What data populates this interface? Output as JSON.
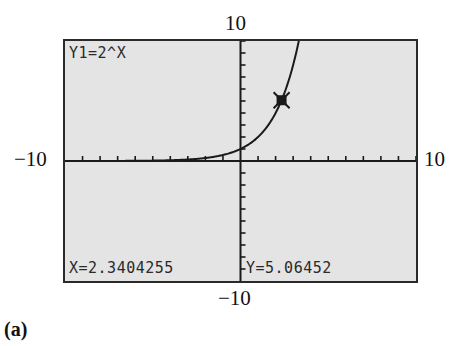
{
  "figure": {
    "sub_label": "(a)"
  },
  "window": {
    "ymax_label": "10",
    "ymin_label": "−10",
    "xmin_label": "−10",
    "xmax_label": "10"
  },
  "screen": {
    "function_label": "Y1=2^X",
    "x_readout": "X=2.3404255",
    "y_readout": "Y=5.06452",
    "background_color": "#e4e4e4",
    "frame_color": "#2a2a2a",
    "curve_color": "#1a1a1a"
  },
  "chart_data": {
    "type": "line",
    "title": "Y1=2^X",
    "function": "y = 2^x",
    "xlabel": "",
    "ylabel": "",
    "xlim": [
      -10,
      10
    ],
    "ylim": [
      -10,
      10
    ],
    "xscl": 1,
    "yscl": 1,
    "grid": false,
    "x_tick_labels": [
      "-10",
      "10"
    ],
    "y_tick_labels": [
      "-10",
      "10"
    ],
    "series": [
      {
        "name": "Y1=2^X",
        "x": [
          -10,
          -5,
          -3,
          -2,
          -1,
          0,
          1,
          2,
          2.3404255,
          3,
          3.3
        ],
        "y": [
          0.001,
          0.031,
          0.125,
          0.25,
          0.5,
          1,
          2,
          4,
          5.06452,
          8,
          9.85
        ]
      }
    ],
    "trace_point": {
      "x": 2.3404255,
      "y": 5.06452
    },
    "legend": [
      "Y1=2^X"
    ],
    "annotations": [
      "X=2.3404255",
      "Y=5.06452"
    ]
  }
}
